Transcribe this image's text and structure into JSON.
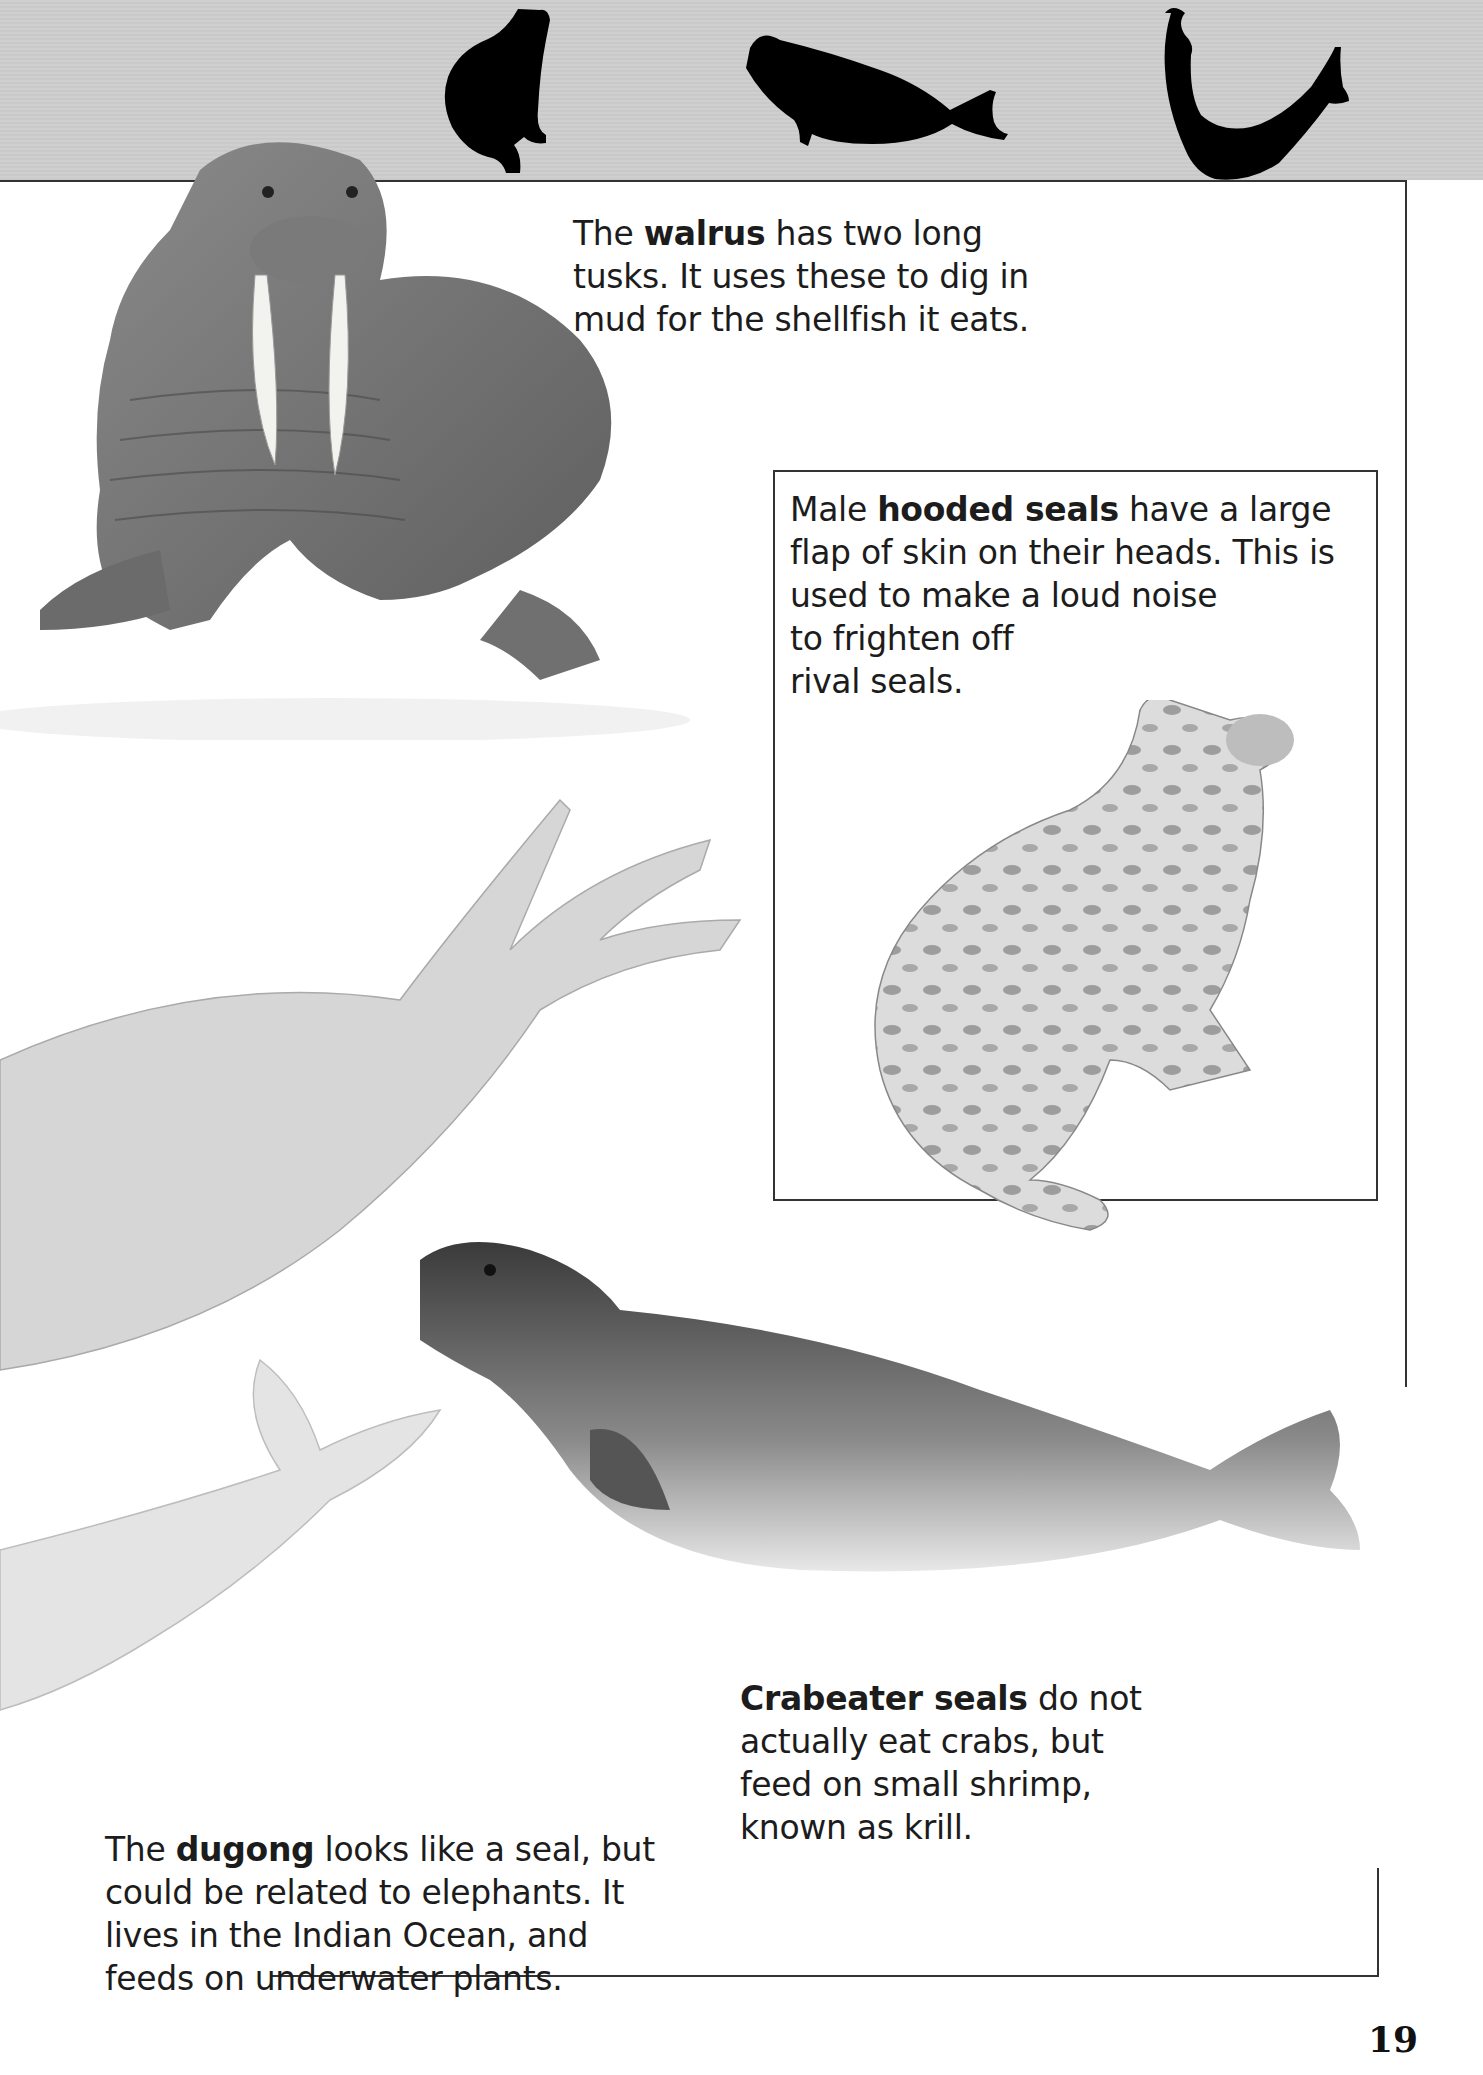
{
  "page": {
    "number": "19",
    "header_icons": [
      "sitting-seal-silhouette-icon",
      "lying-seal-silhouette-icon",
      "arched-seal-silhouette-icon"
    ]
  },
  "captions": {
    "walrus": {
      "prefix": "The ",
      "bold": "walrus",
      "suffix": " has two long tusks. It uses these to dig in mud for the shellfish it eats.",
      "lines": [
        "The walrus has two long",
        "tusks. It uses these to dig in",
        "mud for the shellfish it eats."
      ]
    },
    "hooded_seal": {
      "prefix": "Male ",
      "bold": "hooded seals",
      "suffix": " have a large flap of skin on their heads. This is used to make a loud noise to frighten off rival seals.",
      "lines": [
        "Male hooded seals have a large",
        "flap of skin on their heads. This is",
        "used to make a loud noise",
        "to frighten off",
        "rival seals."
      ]
    },
    "crabeater": {
      "prefix": "",
      "bold": "Crabeater seals",
      "suffix": " do not actually eat crabs, but feed on small shrimp, known as krill.",
      "lines": [
        "Crabeater seals do not",
        "actually eat crabs, but",
        "feed on small shrimp,",
        "known as krill."
      ]
    },
    "dugong": {
      "prefix": "The ",
      "bold": "dugong",
      "suffix": " looks like a seal, but could be related to elephants. It lives in the Indian Ocean, and feeds on underwater plants.",
      "lines": [
        "The dugong looks like a seal, but",
        "could be related to elephants. It",
        "lives in the Indian Ocean, and",
        "feeds on underwater plants."
      ]
    }
  },
  "illustrations": [
    "walrus",
    "hooded seal",
    "sea lion flippers",
    "crabeater seal",
    "dugong tail"
  ],
  "colors": {
    "header_band": "#cbcbcb",
    "silhouette": "#000000",
    "rule": "#333333",
    "text": "#1c1c1c"
  }
}
